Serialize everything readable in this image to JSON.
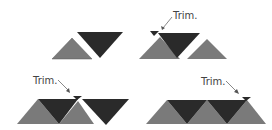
{
  "labels": {
    "trim_top_right": "Trim.",
    "trim_bottom_left": "Trim.",
    "trim_bottom_right": "Trim."
  },
  "colors": {
    "dark": "#2a2a2a",
    "light": "#7a7a7a",
    "background": "#ffffff",
    "arrow": "#555555"
  }
}
